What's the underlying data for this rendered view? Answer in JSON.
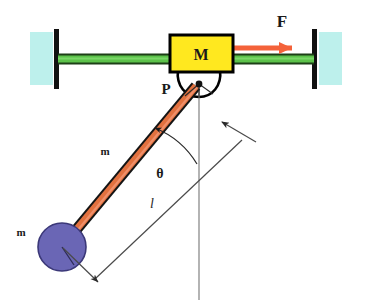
{
  "diagram": {
    "type": "physics-free-body-diagram",
    "canvas": {
      "width": 371,
      "height": 304,
      "background": "#ffffff"
    }
  },
  "labels": {
    "cart_mass": "M",
    "pivot": "P",
    "applied_force": "F",
    "rod_mass": "m",
    "bob_mass": "m",
    "angle": "θ",
    "length": "l"
  },
  "colors": {
    "cart_fill": "#ffe81f",
    "cart_stroke": "#000000",
    "rail_fill": "#5cc24a",
    "rail_edge": "#2f6b24",
    "wall_fill": "#bdf0ec",
    "post_stroke": "#111111",
    "force_arrow": "#f4623a",
    "rod_fill": "#e2713f",
    "rod_stroke": "#141414",
    "bob_fill": "#6a66b5",
    "bob_stroke": "#3d3a78",
    "reference_line": "#8b8b8b",
    "dimension_line": "#555555",
    "text": "#1a1a1a"
  },
  "geometry": {
    "pivot": {
      "x": 199,
      "y": 84
    },
    "bob": {
      "x": 62,
      "y": 247,
      "radius": 24
    },
    "angle_degrees": 45,
    "rod_length_px": 190,
    "cart": {
      "x": 170,
      "y": 36,
      "width": 62,
      "height": 36
    },
    "rail": {
      "y": 58,
      "x1": 60,
      "x2": 312,
      "thickness": 9
    },
    "walls": [
      {
        "side": "left",
        "x": 30,
        "y": 32,
        "width": 22,
        "height": 52,
        "post_x": 57
      },
      {
        "side": "right",
        "x": 320,
        "y": 32,
        "width": 22,
        "height": 52,
        "post_x": 315
      }
    ],
    "force_arrow": {
      "x1": 233,
      "y1": 48,
      "x2": 300,
      "y2": 48
    },
    "reference_line": {
      "x": 199,
      "y1": 84,
      "y2": 300
    }
  },
  "annotations": {
    "angle_arc_note": "arc between pendulum rod and vertical reference line",
    "length_dimension_note": "double-headed arrow parallel to rod marking length l"
  }
}
